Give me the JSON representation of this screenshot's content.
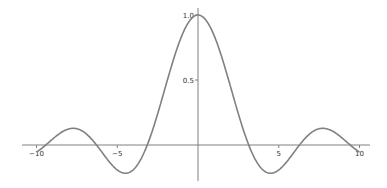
{
  "chart_data": {
    "type": "line",
    "title": "",
    "xlabel": "",
    "ylabel": "",
    "function": "sin(x)/x",
    "xlim": [
      -10.5,
      11
    ],
    "ylim": [
      -0.25,
      1.05
    ],
    "x_ticks": [
      -10,
      -5,
      5,
      10
    ],
    "x_tick_labels": [
      "−10",
      "−5",
      "5",
      "10"
    ],
    "y_ticks": [
      0.5,
      1.0
    ],
    "y_tick_labels": [
      "0.5",
      "1.0"
    ],
    "grid": false,
    "legend": null,
    "line_color": "#808080",
    "axis_color": "#808080",
    "series": [
      {
        "name": "sinc",
        "x": [
          -10,
          -9,
          -8,
          -7.725,
          -7,
          -6.283,
          -5,
          -4.493,
          -4,
          -3.142,
          -2,
          -1,
          0,
          1,
          2,
          3.142,
          4,
          4.493,
          5,
          6.283,
          7,
          7.725,
          8,
          9,
          10
        ],
        "values": [
          -0.054,
          0.046,
          0.124,
          0.128,
          0.094,
          0.0,
          -0.192,
          -0.217,
          -0.189,
          0.0,
          0.455,
          0.841,
          1.0,
          0.841,
          0.455,
          0.0,
          -0.189,
          -0.217,
          -0.192,
          0.0,
          0.094,
          0.128,
          0.124,
          0.046,
          -0.054
        ]
      }
    ]
  }
}
